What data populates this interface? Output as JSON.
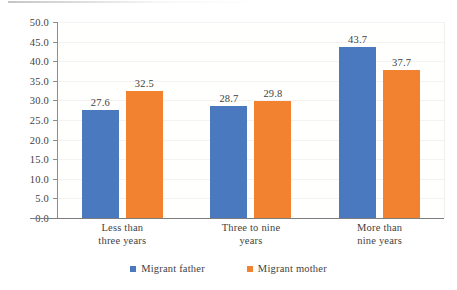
{
  "chart_data": {
    "type": "bar",
    "title": "",
    "subtitle": "",
    "xlabel": "",
    "ylabel": "",
    "ylim": [
      0,
      50
    ],
    "ytick_step": 5,
    "ytick_labels": [
      "0.0",
      "5.0",
      "10.0",
      "15.0",
      "20.0",
      "25.0",
      "30.0",
      "35.0",
      "40.0",
      "45.0",
      "50.0"
    ],
    "categories": [
      "Less than\nthree years",
      "Three to nine\nyears",
      "More than\nnine years"
    ],
    "categories_flat": [
      "Less than three years",
      "Three to nine years",
      "More than nine years"
    ],
    "grid": true,
    "grid_axis": "y",
    "legend_position": "bottom-center",
    "series": [
      {
        "name": "Migrant father",
        "color": "#4A79C0",
        "values": [
          27.6,
          28.7,
          43.7
        ],
        "labels": [
          "27.6",
          "28.7",
          "43.7"
        ]
      },
      {
        "name": "Migrant mother",
        "color": "#F2822F",
        "values": [
          32.5,
          29.8,
          37.7
        ],
        "labels": [
          "32.5",
          "29.8",
          "37.7"
        ]
      }
    ]
  },
  "legend": {
    "items": [
      {
        "label": "Migrant father",
        "swatch": "legend-swatch-blue"
      },
      {
        "label": "Migrant mother",
        "swatch": "legend-swatch-orange"
      }
    ]
  }
}
